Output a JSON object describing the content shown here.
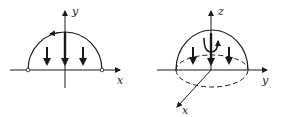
{
  "figures": [
    {
      "id": "left",
      "description": "2D semicircle with downward field arrows",
      "axes": {
        "horizontal": "x",
        "vertical": "y"
      },
      "arrows_down": 3,
      "circulation": "counterclockwise arrow on arc"
    },
    {
      "id": "right",
      "description": "3D hemisphere with downward field arrows and circulation symbol",
      "axes": {
        "vertical": "z",
        "horizontal": "y",
        "oblique": "x"
      },
      "arrows_down": 3,
      "circulation": "curl arrow around z axis"
    }
  ],
  "labels": {
    "left_y": "y",
    "left_x": "x",
    "right_z": "z",
    "right_y": "y",
    "right_x": "x"
  },
  "colors": {
    "ink": "#1a1a1a",
    "background": "#ffffff"
  }
}
